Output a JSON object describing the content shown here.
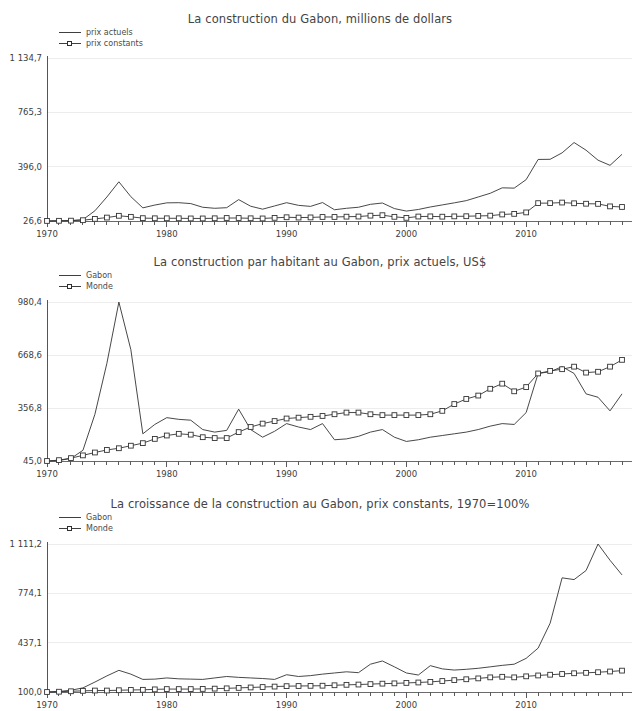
{
  "charts": [
    {
      "id": "chart-1",
      "title": "La construction du Gabon, millions de dollars",
      "legend": [
        {
          "label": "prix actuels",
          "marker": "none"
        },
        {
          "label": "prix constants",
          "marker": "square"
        }
      ],
      "chart_data": {
        "type": "line",
        "title": "La construction du Gabon, millions de dollars",
        "xlabel": "",
        "ylabel": "millions de dollars",
        "xlim": [
          1970,
          2018
        ],
        "ylim": [
          26.6,
          1134.7
        ],
        "grid": true,
        "legend_position": "top-left",
        "yticks": [
          26.6,
          396.0,
          765.3,
          1134.7
        ],
        "ytick_labels": [
          "26,6",
          "396,0",
          "765,3",
          "1 134,7"
        ],
        "xticks": [
          1970,
          1980,
          1990,
          2000,
          2010
        ],
        "xtick_labels": [
          "1970",
          "1980",
          "1990",
          "2000",
          "2010"
        ],
        "x": [
          1970,
          1971,
          1972,
          1973,
          1974,
          1975,
          1976,
          1977,
          1978,
          1979,
          1980,
          1981,
          1982,
          1983,
          1984,
          1985,
          1986,
          1987,
          1988,
          1989,
          1990,
          1991,
          1992,
          1993,
          1994,
          1995,
          1996,
          1997,
          1998,
          1999,
          2000,
          2001,
          2002,
          2003,
          2004,
          2005,
          2006,
          2007,
          2008,
          2009,
          2010,
          2011,
          2012,
          2013,
          2014,
          2015,
          2016,
          2017,
          2018
        ],
        "series": [
          {
            "name": "prix actuels",
            "marker": "none",
            "values": [
              27,
              28,
              30,
              36,
              96,
              190,
              293,
              192,
              116,
              135,
              150,
              151,
              145,
              120,
              113,
              117,
              172,
              127,
              107,
              129,
              151,
              133,
              126,
              152,
              103,
              113,
              120,
              140,
              149,
              111,
              94,
              105,
              122,
              136,
              150,
              165,
              190,
              215,
              252,
              250,
              308,
              445,
              446,
              490,
              560,
              508,
              440,
              405,
              480
            ]
          },
          {
            "name": "prix constants",
            "marker": "square",
            "values": [
              27,
              28,
              29,
              32,
              41,
              50,
              62,
              55,
              46,
              45,
              45,
              45,
              44,
              44,
              45,
              47,
              47,
              45,
              44,
              48,
              52,
              50,
              51,
              54,
              54,
              56,
              57,
              63,
              66,
              55,
              48,
              57,
              58,
              56,
              58,
              59,
              61,
              63,
              71,
              75,
              85,
              148,
              148,
              152,
              147,
              144,
              143,
              126,
              122
            ]
          }
        ]
      }
    },
    {
      "id": "chart-2",
      "title": "La construction par habitant au Gabon, prix actuels, US$",
      "legend": [
        {
          "label": "Gabon",
          "marker": "none"
        },
        {
          "label": "Monde",
          "marker": "square"
        }
      ],
      "chart_data": {
        "type": "line",
        "title": "La construction par habitant au Gabon, prix actuels, US$",
        "xlabel": "",
        "ylabel": "US$",
        "xlim": [
          1970,
          2018
        ],
        "ylim": [
          45.0,
          980.4
        ],
        "grid": true,
        "legend_position": "top-left",
        "yticks": [
          45.0,
          356.8,
          668.6,
          980.4
        ],
        "ytick_labels": [
          "45,0",
          "356,8",
          "668,6",
          "980,4"
        ],
        "xticks": [
          1970,
          1980,
          1990,
          2000,
          2010
        ],
        "xtick_labels": [
          "1970",
          "1990",
          "1990",
          "2000",
          "2010"
        ],
        "x": [
          1970,
          1971,
          1972,
          1973,
          1974,
          1975,
          1976,
          1977,
          1978,
          1979,
          1980,
          1981,
          1982,
          1983,
          1984,
          1985,
          1986,
          1987,
          1988,
          1989,
          1990,
          1991,
          1992,
          1993,
          1994,
          1995,
          1996,
          1997,
          1998,
          1999,
          2000,
          2001,
          2002,
          2003,
          2004,
          2005,
          2006,
          2007,
          2008,
          2009,
          2010,
          2011,
          2012,
          2013,
          2014,
          2015,
          2016,
          2017,
          2018
        ],
        "series": [
          {
            "name": "Gabon",
            "marker": "none",
            "values": [
              45,
              48,
              60,
              108,
              320,
              620,
              980,
              700,
              205,
              260,
              300,
              290,
              285,
              230,
              215,
              225,
              350,
              230,
              185,
              220,
              265,
              245,
              230,
              265,
              170,
              175,
              190,
              215,
              230,
              185,
              160,
              170,
              185,
              195,
              205,
              215,
              230,
              250,
              265,
              260,
              330,
              560,
              570,
              600,
              560,
              440,
              420,
              340,
              440
            ]
          },
          {
            "name": "Monde",
            "marker": "square",
            "values": [
              45,
              50,
              62,
              78,
              95,
              110,
              120,
              135,
              150,
              175,
              195,
              205,
              200,
              185,
              180,
              180,
              215,
              245,
              265,
              280,
              295,
              300,
              305,
              310,
              320,
              330,
              330,
              320,
              315,
              315,
              315,
              315,
              320,
              340,
              380,
              410,
              430,
              470,
              500,
              455,
              480,
              560,
              575,
              585,
              600,
              565,
              570,
              600,
              640
            ]
          }
        ]
      }
    },
    {
      "id": "chart-3",
      "title": "La croissance de la construction au Gabon, prix constants, 1970=100%",
      "legend": [
        {
          "label": "Gabon",
          "marker": "none"
        },
        {
          "label": "Monde",
          "marker": "square"
        }
      ],
      "chart_data": {
        "type": "line",
        "title": "La croissance de la construction au Gabon, prix constants, 1970=100%",
        "xlabel": "",
        "ylabel": "1970=100%",
        "xlim": [
          1970,
          2018
        ],
        "ylim": [
          100.0,
          1111.2
        ],
        "grid": true,
        "legend_position": "top-left",
        "yticks": [
          100.0,
          437.1,
          774.1,
          1111.2
        ],
        "ytick_labels": [
          "100,0",
          "437,1",
          "774,1",
          "1 111,2"
        ],
        "xticks": [
          1970,
          1980,
          1990,
          2000,
          2010
        ],
        "xtick_labels": [
          "1970",
          "1980",
          "1990",
          "2000",
          "2010"
        ],
        "x": [
          1970,
          1971,
          1972,
          1973,
          1974,
          1975,
          1976,
          1977,
          1978,
          1979,
          1980,
          1981,
          1982,
          1983,
          1984,
          1985,
          1986,
          1987,
          1988,
          1989,
          1990,
          1991,
          1992,
          1993,
          1994,
          1995,
          1996,
          1997,
          1998,
          1999,
          2000,
          2001,
          2002,
          2003,
          2004,
          2005,
          2006,
          2007,
          2008,
          2009,
          2010,
          2011,
          2012,
          2013,
          2014,
          2015,
          2016,
          2017,
          2018
        ],
        "series": [
          {
            "name": "Gabon",
            "marker": "none",
            "values": [
              100,
              104,
              112,
              128,
              168,
              210,
              248,
              222,
              186,
              188,
              196,
              190,
              188,
              186,
              196,
              206,
              200,
              196,
              192,
              186,
              218,
              206,
              212,
              222,
              230,
              238,
              232,
              290,
              312,
              272,
              230,
              216,
              280,
              258,
              250,
              255,
              262,
              272,
              282,
              290,
              330,
              400,
              570,
              880,
              868,
              930,
              1111,
              1000,
              900
            ]
          },
          {
            "name": "Monde",
            "marker": "square",
            "values": [
              100,
              102,
              105,
              108,
              110,
              110,
              112,
              114,
              115,
              118,
              120,
              120,
              120,
              121,
              123,
              125,
              128,
              131,
              134,
              137,
              140,
              141,
              142,
              143,
              146,
              149,
              151,
              154,
              157,
              159,
              162,
              165,
              169,
              175,
              181,
              187,
              193,
              200,
              204,
              200,
              207,
              213,
              218,
              223,
              228,
              231,
              235,
              240,
              246
            ]
          }
        ]
      }
    }
  ]
}
